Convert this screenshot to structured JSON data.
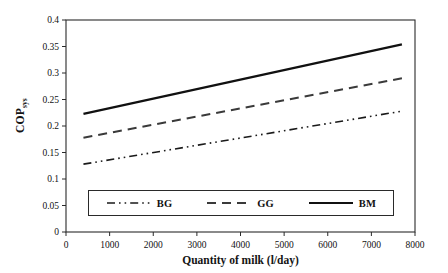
{
  "chart_data": {
    "type": "line",
    "title": "",
    "xlabel": "Quantity of milk (l/day)",
    "ylabel": "COP",
    "ylabel_subscript": "sys",
    "xlim": [
      0,
      8000
    ],
    "ylim": [
      0,
      0.4
    ],
    "xticks": [
      0,
      1000,
      2000,
      3000,
      4000,
      5000,
      6000,
      7000,
      8000
    ],
    "xticklabels": [
      "0",
      "1000",
      "2000",
      "3000",
      "4000",
      "5000",
      "6000",
      "7000",
      "8000"
    ],
    "yticks": [
      0,
      0.05,
      0.1,
      0.15,
      0.2,
      0.25,
      0.3,
      0.35,
      0.4
    ],
    "yticklabels": [
      "0",
      "0.05",
      "0.1",
      "0.15",
      "0.2",
      "0.25",
      "0.3",
      "0.35",
      "0.4"
    ],
    "grid": false,
    "legend_position": "lower-center",
    "x": [
      400,
      7700
    ],
    "series": [
      {
        "name": "BG",
        "label": "BG",
        "style": "dash-dot-dot",
        "color": "#1a1a1a",
        "width": 1.6,
        "values": [
          0.128,
          0.228
        ]
      },
      {
        "name": "GG",
        "label": "GG",
        "style": "dashed",
        "color": "#3a3a3a",
        "width": 2.0,
        "values": [
          0.178,
          0.29
        ]
      },
      {
        "name": "BM",
        "label": "BM",
        "style": "solid",
        "color": "#111111",
        "width": 2.2,
        "values": [
          0.223,
          0.354
        ]
      }
    ]
  },
  "axes": {
    "frame_color": "#2a2a2a",
    "tick_color": "#2a2a2a"
  }
}
